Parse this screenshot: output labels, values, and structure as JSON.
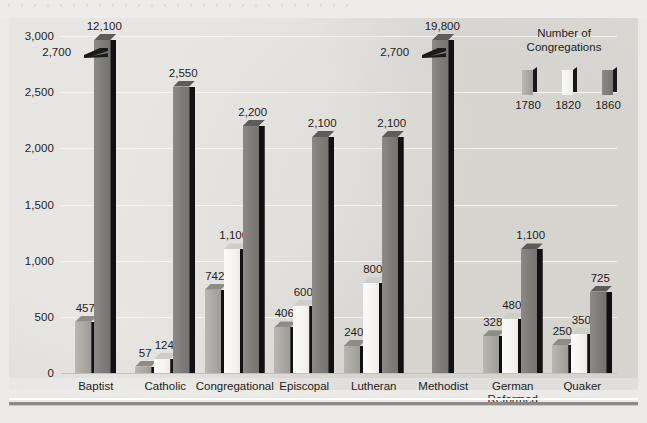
{
  "legend": {
    "title_line1": "Number of",
    "title_line2": "Congregations",
    "keys": [
      "1780",
      "1820",
      "1860"
    ]
  },
  "axis": {
    "yticks": [
      "0",
      "500",
      "1,000",
      "1,500",
      "2,000",
      "2,500",
      "3,000"
    ]
  },
  "chart_data": {
    "type": "bar",
    "title": "Number of Congregations",
    "xlabel": "",
    "ylabel": "Number of Congregations",
    "ylim": [
      0,
      3000
    ],
    "grid": true,
    "legend_position": "top-right",
    "categories": [
      "Baptist",
      "Catholic",
      "Congregational",
      "Episcopal",
      "Lutheran",
      "Methodist",
      "German Reformed",
      "Quaker"
    ],
    "series": [
      {
        "name": "1780",
        "values": [
          457,
          57,
          742,
          406,
          240,
          null,
          328,
          250
        ]
      },
      {
        "name": "1820",
        "values": [
          2700,
          124,
          1100,
          600,
          800,
          2700,
          480,
          350
        ]
      },
      {
        "name": "1860",
        "values": [
          12100,
          2550,
          2200,
          2100,
          2100,
          19800,
          1100,
          725
        ]
      }
    ]
  },
  "groups": [
    {
      "name": "Baptist",
      "label_lines": [
        "Baptist"
      ],
      "bars": [
        {
          "series": "1780",
          "value": 457,
          "label": "457",
          "truncated": false
        },
        {
          "series": "1860",
          "value": 12100,
          "label": "12,100",
          "truncated": true,
          "break_label": "2,700"
        }
      ]
    },
    {
      "name": "Catholic",
      "label_lines": [
        "Catholic"
      ],
      "bars": [
        {
          "series": "1780",
          "value": 57,
          "label": "57",
          "truncated": false
        },
        {
          "series": "1820",
          "value": 124,
          "label": "124",
          "truncated": false
        },
        {
          "series": "1860",
          "value": 2550,
          "label": "2,550",
          "truncated": false
        }
      ]
    },
    {
      "name": "Congregational",
      "label_lines": [
        "Congregational"
      ],
      "bars": [
        {
          "series": "1780",
          "value": 742,
          "label": "742",
          "truncated": false
        },
        {
          "series": "1820",
          "value": 1100,
          "label": "1,100",
          "truncated": false
        },
        {
          "series": "1860",
          "value": 2200,
          "label": "2,200",
          "truncated": false
        }
      ]
    },
    {
      "name": "Episcopal",
      "label_lines": [
        "Episcopal"
      ],
      "bars": [
        {
          "series": "1780",
          "value": 406,
          "label": "406",
          "truncated": false
        },
        {
          "series": "1820",
          "value": 600,
          "label": "600",
          "truncated": false
        },
        {
          "series": "1860",
          "value": 2100,
          "label": "2,100",
          "truncated": false
        }
      ]
    },
    {
      "name": "Lutheran",
      "label_lines": [
        "Lutheran"
      ],
      "bars": [
        {
          "series": "1780",
          "value": 240,
          "label": "240",
          "truncated": false
        },
        {
          "series": "1820",
          "value": 800,
          "label": "800",
          "truncated": false
        },
        {
          "series": "1860",
          "value": 2100,
          "label": "2,100",
          "truncated": false
        }
      ]
    },
    {
      "name": "Methodist",
      "label_lines": [
        "Methodist"
      ],
      "bars": [
        {
          "series": "1860",
          "value": 19800,
          "label": "19,800",
          "truncated": true,
          "break_label": "2,700"
        }
      ]
    },
    {
      "name": "German Reformed",
      "label_lines": [
        "German",
        "Reformed"
      ],
      "bars": [
        {
          "series": "1780",
          "value": 328,
          "label": "328",
          "truncated": false
        },
        {
          "series": "1820",
          "value": 480,
          "label": "480",
          "truncated": false
        },
        {
          "series": "1860",
          "value": 1100,
          "label": "1,100",
          "truncated": false
        }
      ]
    },
    {
      "name": "Quaker",
      "label_lines": [
        "Quaker"
      ],
      "bars": [
        {
          "series": "1780",
          "value": 250,
          "label": "250",
          "truncated": false
        },
        {
          "series": "1820",
          "value": 350,
          "label": "350",
          "truncated": false
        },
        {
          "series": "1860",
          "value": 725,
          "label": "725",
          "truncated": false
        }
      ]
    }
  ]
}
